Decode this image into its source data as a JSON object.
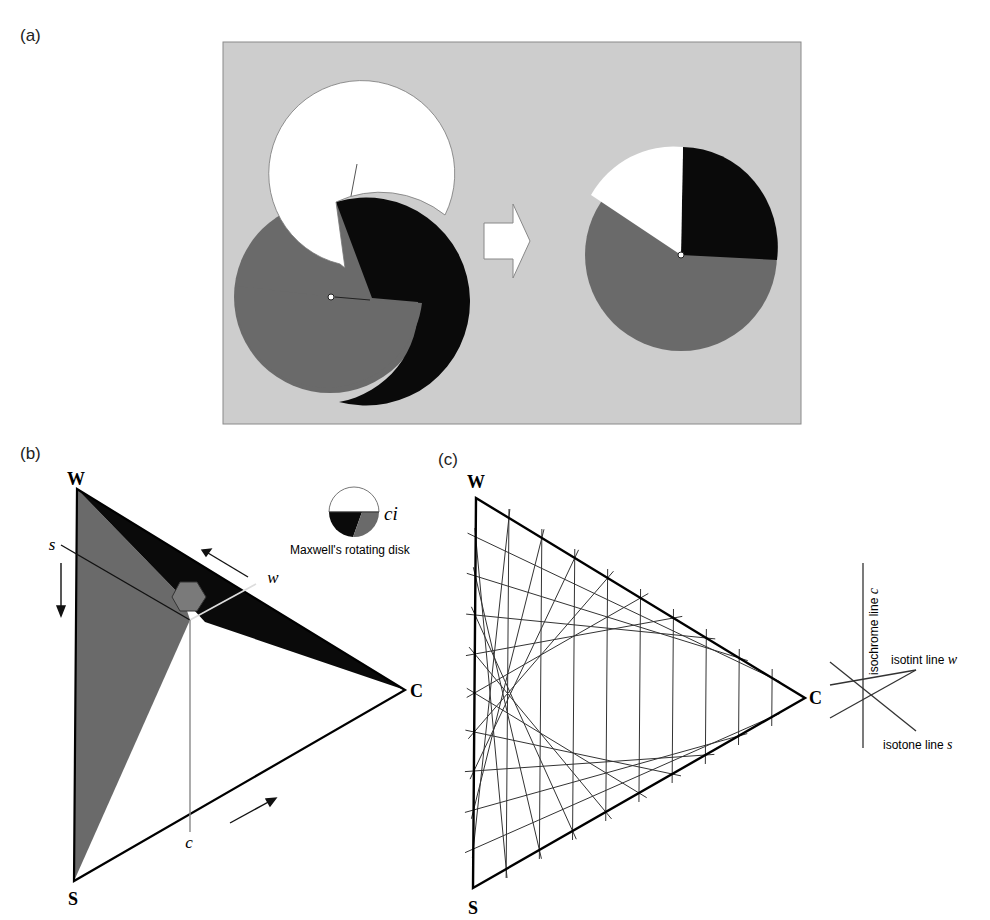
{
  "panels": {
    "a": {
      "label": "(a)",
      "description": "Maxwell's rotating disk: three interlocking slit disks (white, black, gray) combine into a single disk with sectors",
      "colors": {
        "background": "#cdcdcd",
        "white": "#ffffff",
        "black": "#0a0a0a",
        "gray": "#6a6a6a"
      }
    },
    "b": {
      "label": "(b)",
      "vertices": {
        "W": "W",
        "C": "C",
        "S": "S"
      },
      "axis_labels": {
        "s": "s",
        "w": "w",
        "c": "c"
      },
      "legend": {
        "symbol_label": "ci",
        "caption": "Maxwell's rotating disk"
      }
    },
    "c": {
      "label": "(c)",
      "vertices": {
        "W": "W",
        "C": "C",
        "S": "S"
      },
      "grid_divisions": 10,
      "legend": {
        "isochrome": "isochrome line c",
        "isotint": "isotint line w",
        "isotone": "isotone line s"
      }
    }
  }
}
